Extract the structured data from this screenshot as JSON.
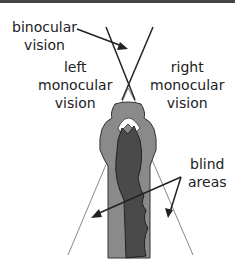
{
  "labels": {
    "binocular_line1": "binocular",
    "binocular_line2": "vision",
    "left_line1": "left",
    "left_line2": "monocular",
    "left_line3": "vision",
    "right_line1": "right",
    "right_line2": "monocular",
    "right_line3": "vision",
    "blind_line1": "blind",
    "blind_line2": "areas"
  },
  "colors": {
    "head_outer": "#8a8a8a",
    "head_inner": "#4a4a4a",
    "mouth": "#ffffff",
    "lines": "#222222",
    "border": "#444444"
  }
}
